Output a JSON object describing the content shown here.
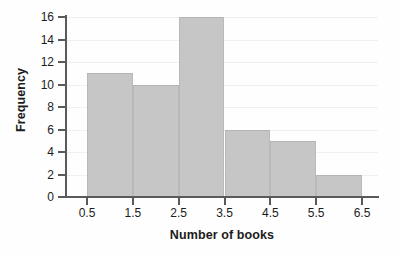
{
  "chart_data": {
    "type": "bar",
    "title": "",
    "subtitle": "",
    "xlabel": "Number of books",
    "ylabel": "Frequency",
    "categories": [
      "0.5-1.5",
      "1.5-2.5",
      "2.5-3.5",
      "3.5-4.5",
      "4.5-5.5",
      "5.5-6.5"
    ],
    "bin_edges": [
      0.5,
      1.5,
      2.5,
      3.5,
      4.5,
      5.5,
      6.5
    ],
    "values": [
      11,
      10,
      16,
      6,
      5,
      2
    ],
    "bin_width": 1,
    "xlim": [
      0.5,
      6.5
    ],
    "ylim": [
      0,
      16
    ],
    "xticks": [
      0.5,
      1.5,
      2.5,
      3.5,
      4.5,
      5.5,
      6.5
    ],
    "xtick_labels": [
      "0.5",
      "1.5",
      "2.5",
      "3.5",
      "4.5",
      "5.5",
      "6.5"
    ],
    "yticks": [
      0,
      2,
      4,
      6,
      8,
      10,
      12,
      14,
      16
    ],
    "ytick_labels": [
      "0",
      "2",
      "4",
      "6",
      "8",
      "10",
      "12",
      "14",
      "16"
    ],
    "grid": "faint-horizontal",
    "legend": "none",
    "bar_color": "#c6c6c6",
    "bar_edge_color": "#b4b4b4",
    "axis_color": "#5a5a5a",
    "text_color": "#1c1c1c",
    "background_color": "#fefefe"
  }
}
